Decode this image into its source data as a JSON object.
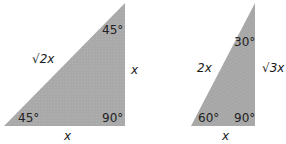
{
  "diagram": {
    "triangles": [
      {
        "name": "45-45-90 triangle",
        "fill": "#a9a9a9",
        "angles": {
          "top": "45°",
          "bottom_left": "45°",
          "bottom_right": "90°"
        },
        "sides": {
          "hypotenuse": "√2x",
          "vertical": "x",
          "base": "x"
        }
      },
      {
        "name": "30-60-90 triangle",
        "fill": "#a9a9a9",
        "angles": {
          "top": "30°",
          "bottom_left": "60°",
          "bottom_right": "90°"
        },
        "sides": {
          "hypotenuse": "2x",
          "vertical": "√3x",
          "base": "x"
        }
      }
    ]
  }
}
